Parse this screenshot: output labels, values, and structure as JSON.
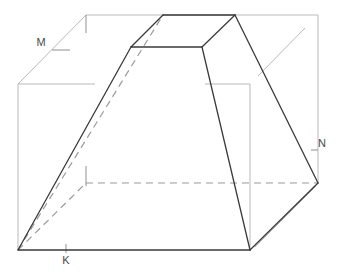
{
  "figure": {
    "type": "geometric-line-diagram",
    "background_color": "#ffffff",
    "canvas": {
      "width": 343,
      "height": 277
    },
    "colors": {
      "solid_edge": "#3a3a3a",
      "box_edge": "#b9b9b9",
      "hidden_edge": "#9a9a9a",
      "tick_mark": "#8f8f8f",
      "label_text": "#4a4a4a"
    },
    "labels": [
      {
        "id": "label-m",
        "text": "M",
        "x": 41,
        "y": 46,
        "anchor": "middle"
      },
      {
        "id": "label-k",
        "text": "K",
        "x": 66,
        "y": 264,
        "anchor": "middle"
      },
      {
        "id": "label-n",
        "text": "N",
        "x": 322,
        "y": 147,
        "anchor": "middle"
      }
    ],
    "vertices": {
      "box": {
        "front_bottom_left": [
          18,
          250
        ],
        "front_bottom_right": [
          250,
          250
        ],
        "front_top_left": [
          18,
          84
        ],
        "front_top_right": [
          250,
          84
        ],
        "back_bottom_left": [
          86,
          183
        ],
        "back_bottom_right": [
          318,
          183
        ],
        "back_top_left": [
          86,
          15
        ],
        "back_top_right": [
          318,
          15
        ]
      },
      "frustum": {
        "base_front_left": [
          18,
          250
        ],
        "base_front_right": [
          250,
          250
        ],
        "base_back_left": [
          86,
          183
        ],
        "base_back_right": [
          318,
          183
        ],
        "top_front_left": [
          131,
          47
        ],
        "top_front_right": [
          202,
          47
        ],
        "top_back_left": [
          163,
          15
        ],
        "top_back_right": [
          235,
          15
        ]
      }
    },
    "edges": {
      "solid_count": 11,
      "hidden_dashed_count": 3,
      "box_guide_count": 9,
      "tick_mark_count": 5
    },
    "notes": {
      "hidden_edges_style": "dashed",
      "box_style": "light gray construction lines",
      "frustum_style": "dark gray solid lines"
    }
  }
}
